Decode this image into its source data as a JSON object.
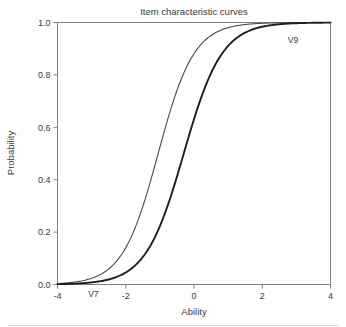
{
  "chart_data": {
    "type": "line",
    "title": "Item characteristic curves",
    "xlabel": "Ability",
    "ylabel": "Probability",
    "xlim": [
      -4,
      4
    ],
    "ylim": [
      0,
      1
    ],
    "grid": false,
    "legend_position": "inline-annotations",
    "xticks": [
      "-4",
      "-2",
      "0",
      "2",
      "4"
    ],
    "xtick_values": [
      -4,
      -2,
      0,
      2,
      4
    ],
    "yticks": [
      "0.0",
      "0.2",
      "0.4",
      "0.6",
      "0.8",
      "1.0"
    ],
    "ytick_values": [
      0.0,
      0.2,
      0.4,
      0.6,
      0.8,
      1.0
    ],
    "x": [
      -4,
      -3.6,
      -3.2,
      -2.8,
      -2.4,
      -2,
      -1.6,
      -1.2,
      -0.8,
      -0.4,
      0,
      0.4,
      0.8,
      1.2,
      1.6,
      2,
      2.4,
      2.8,
      3.2,
      3.6,
      4
    ],
    "series": [
      {
        "name": "V9",
        "label": "V9",
        "color": "#4a4a4a",
        "line_width": 1.1,
        "difficulty": -1.05,
        "discrimination": 1.12,
        "values": [
          0.046,
          0.07,
          0.104,
          0.152,
          0.216,
          0.298,
          0.396,
          0.503,
          0.608,
          0.702,
          0.78,
          0.841,
          0.887,
          0.92,
          0.944,
          0.96,
          0.972,
          0.98,
          0.986,
          0.99,
          0.993
        ]
      },
      {
        "name": "V7",
        "label": "V7",
        "color": "#1f1f1f",
        "line_width": 1.9,
        "difficulty": -0.3,
        "discrimination": 1.05,
        "values": [
          0.024,
          0.036,
          0.054,
          0.08,
          0.117,
          0.168,
          0.235,
          0.318,
          0.412,
          0.512,
          0.61,
          0.698,
          0.772,
          0.831,
          0.876,
          0.91,
          0.935,
          0.953,
          0.966,
          0.976,
          0.982
        ]
      }
    ],
    "annotations": [
      {
        "text": "V7",
        "x": -2.95,
        "y": -0.035,
        "series": "V7"
      },
      {
        "text": "V9",
        "x": 2.9,
        "y": 0.935,
        "series": "V9"
      }
    ]
  }
}
